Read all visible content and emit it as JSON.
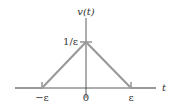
{
  "figure": {
    "type": "triangular-pulse",
    "y_axis_label": "v(t)",
    "x_axis_label": "t",
    "peak_label": "1/ε",
    "x_ticks": [
      {
        "label": "−ε",
        "value": "-epsilon"
      },
      {
        "label": "0",
        "value": "0"
      },
      {
        "label": "ε",
        "value": "epsilon"
      }
    ],
    "colors": {
      "function_line": "#999999",
      "axis_line": "#333333",
      "text": "#333333"
    }
  }
}
